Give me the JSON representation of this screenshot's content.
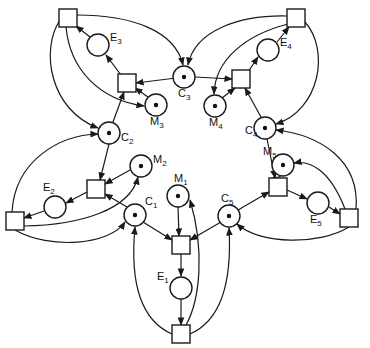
{
  "diagram": {
    "type": "petri-net",
    "places": [
      {
        "id": "C1",
        "label": "C",
        "sub": "1",
        "x": 135,
        "y": 215,
        "token": true
      },
      {
        "id": "C2",
        "label": "C",
        "sub": "2",
        "x": 109,
        "y": 133,
        "token": true
      },
      {
        "id": "C3",
        "label": "C",
        "sub": "3",
        "x": 184,
        "y": 77,
        "token": true
      },
      {
        "id": "C4",
        "label": "C",
        "sub": "4",
        "x": 265,
        "y": 128,
        "token": true
      },
      {
        "id": "C5",
        "label": "C",
        "sub": "5",
        "x": 229,
        "y": 216,
        "token": true
      },
      {
        "id": "M1",
        "label": "M",
        "sub": "1",
        "x": 178,
        "y": 196,
        "token": true
      },
      {
        "id": "M2",
        "label": "M",
        "sub": "2",
        "x": 141,
        "y": 166,
        "token": true
      },
      {
        "id": "M3",
        "label": "M",
        "sub": "3",
        "x": 156,
        "y": 105,
        "token": true
      },
      {
        "id": "M4",
        "label": "M",
        "sub": "4",
        "x": 215,
        "y": 106,
        "token": true
      },
      {
        "id": "M5",
        "label": "M",
        "sub": "5",
        "x": 283,
        "y": 165,
        "token": true
      },
      {
        "id": "E1",
        "label": "E",
        "sub": "1",
        "x": 181,
        "y": 288,
        "token": false
      },
      {
        "id": "E2",
        "label": "E",
        "sub": "2",
        "x": 55,
        "y": 207,
        "token": false
      },
      {
        "id": "E3",
        "label": "E",
        "sub": "3",
        "x": 98,
        "y": 45,
        "token": false
      },
      {
        "id": "E4",
        "label": "E",
        "sub": "4",
        "x": 268,
        "y": 50,
        "token": false
      },
      {
        "id": "E5",
        "label": "E",
        "sub": "5",
        "x": 318,
        "y": 203,
        "token": false
      }
    ],
    "transitions": [
      {
        "id": "T1in",
        "x": 181,
        "y": 245
      },
      {
        "id": "T1out",
        "x": 181,
        "y": 334
      },
      {
        "id": "T2in",
        "x": 96,
        "y": 189
      },
      {
        "id": "T2out",
        "x": 15,
        "y": 221
      },
      {
        "id": "T3in",
        "x": 127,
        "y": 83
      },
      {
        "id": "T3out",
        "x": 68,
        "y": 18
      },
      {
        "id": "T4in",
        "x": 241,
        "y": 79
      },
      {
        "id": "T4out",
        "x": 296,
        "y": 18
      },
      {
        "id": "T5in",
        "x": 278,
        "y": 187
      },
      {
        "id": "T5out",
        "x": 349,
        "y": 218
      }
    ]
  }
}
